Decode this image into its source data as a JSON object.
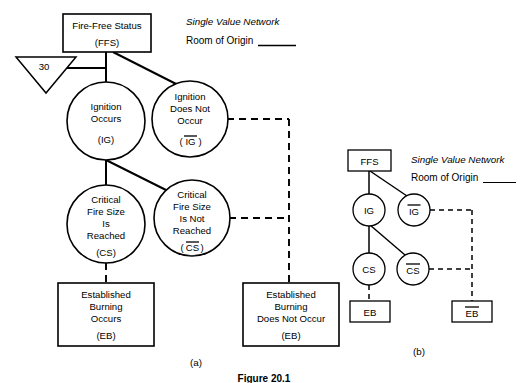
{
  "figure": {
    "caption": "Figure 20.1",
    "panel_a_label": "(a)",
    "panel_b_label": "(b)"
  },
  "headers": {
    "panel_a": {
      "title": "Single Value Network",
      "subtitle": "Room of Origin"
    },
    "panel_b": {
      "title": "Single Value Network",
      "subtitle": "Room of Origin"
    }
  },
  "panel_a": {
    "ffs": {
      "line1": "Fire-Free Status",
      "abbr": "(FFS)"
    },
    "triangle": {
      "value": "30"
    },
    "ignition_occurs": {
      "line1": "Ignition",
      "line2": "Occurs",
      "abbr": "(IG)"
    },
    "ignition_not_occur": {
      "line1": "Ignition",
      "line2": "Does Not",
      "line3": "Occur",
      "abbr_open": "(",
      "abbr_bar": "IG",
      "abbr_close": ")"
    },
    "critical_reached": {
      "line1": "Critical",
      "line2": "Fire Size",
      "line3": "Is",
      "line4": "Reached",
      "abbr": "(CS)"
    },
    "critical_not_reached": {
      "line1": "Critical",
      "line2": "Fire Size",
      "line3": "Is Not",
      "line4": "Reached",
      "abbr_open": "(",
      "abbr_bar": "CS",
      "abbr_close": ")"
    },
    "established_occurs": {
      "line1": "Established",
      "line2": "Burning",
      "line3": "Occurs",
      "abbr": "(EB)"
    },
    "established_not_occur": {
      "line1": "Established",
      "line2": "Burning",
      "line3": "Does Not Occur",
      "abbr": "(EB)"
    }
  },
  "panel_b": {
    "ffs": "FFS",
    "ig": "IG",
    "ig_bar": "IG",
    "cs": "CS",
    "cs_bar": "CS",
    "eb": "EB",
    "eb_bar": "EB"
  },
  "colors": {
    "stroke": "#000000",
    "background": "#ffffff"
  }
}
